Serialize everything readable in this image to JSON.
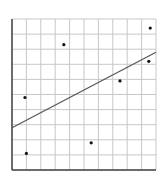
{
  "chart_data": {
    "type": "scatter",
    "title": "",
    "xlabel": "",
    "ylabel": "",
    "xlim": [
      0,
      10
    ],
    "ylim": [
      0,
      10
    ],
    "grid": true,
    "grid_divisions": {
      "x": 10,
      "y": 10
    },
    "tick_labels": {
      "x": [],
      "y": []
    },
    "legend": null,
    "points": [
      {
        "x": 1.0,
        "y": 1.1
      },
      {
        "x": 0.9,
        "y": 4.8
      },
      {
        "x": 3.6,
        "y": 8.3
      },
      {
        "x": 5.5,
        "y": 1.8
      },
      {
        "x": 7.5,
        "y": 5.9
      },
      {
        "x": 9.5,
        "y": 7.2
      },
      {
        "x": 9.6,
        "y": 9.4
      }
    ],
    "trend_line": {
      "x0": 0,
      "y0": 2.8,
      "x1": 10,
      "y1": 7.8
    },
    "colors": {
      "grid": "#c8c8c8",
      "axis": "#444444",
      "point": "#111111",
      "line": "#555555"
    }
  }
}
